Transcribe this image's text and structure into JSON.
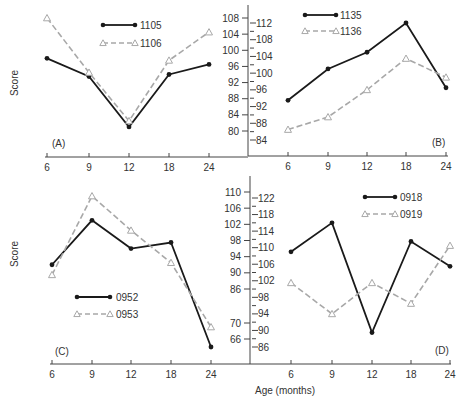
{
  "figure": {
    "y_axis_title": "Score",
    "x_axis_title": "Age (months)",
    "colors": {
      "solid": "#1a1a1a",
      "dashed": "#a8a8a8",
      "axis": "#444444"
    }
  },
  "chart_data": [
    {
      "type": "line",
      "panel": "(A)",
      "categories": [
        "6",
        "9",
        "12",
        "18",
        "24"
      ],
      "xlabel": "Age (months)",
      "ylabel": "Score",
      "yticks": [
        108,
        104,
        100,
        96,
        92,
        88,
        84,
        80
      ],
      "ylim": [
        80,
        108
      ],
      "series": [
        {
          "name": "1105",
          "style": "solid-dot",
          "values": [
            98,
            93.5,
            81,
            94,
            96.5
          ]
        },
        {
          "name": "1106",
          "style": "dashed-triangle",
          "values": [
            108,
            94.5,
            82.5,
            97.5,
            104.5
          ]
        }
      ],
      "legend_position": "top-center",
      "grid": false
    },
    {
      "type": "line",
      "panel": "(B)",
      "categories": [
        "6",
        "9",
        "12",
        "18",
        "24"
      ],
      "xlabel": "Age (months)",
      "ylabel": "Score",
      "yticks": [
        112,
        108,
        104,
        100,
        96,
        92,
        88,
        84
      ],
      "ylim": [
        84,
        112
      ],
      "series": [
        {
          "name": "1135",
          "style": "solid-dot",
          "values": [
            93.5,
            101,
            105,
            112,
            96.5
          ]
        },
        {
          "name": "1136",
          "style": "dashed-triangle",
          "values": [
            86.5,
            89.5,
            96,
            103.5,
            99
          ]
        }
      ],
      "legend_position": "top-left",
      "grid": false
    },
    {
      "type": "line",
      "panel": "(C)",
      "categories": [
        "6",
        "9",
        "12",
        "18",
        "24"
      ],
      "xlabel": "Age (months)",
      "ylabel": "Score",
      "yticks": [
        110,
        106,
        102,
        98,
        94,
        90,
        86,
        70,
        66
      ],
      "ylim": [
        62,
        110
      ],
      "axis_break": [
        70,
        86
      ],
      "series": [
        {
          "name": "0952",
          "style": "solid-dot",
          "values": [
            92,
            103,
            96,
            97.5,
            64
          ]
        },
        {
          "name": "0953",
          "style": "dashed-triangle",
          "values": [
            89.5,
            109,
            100.5,
            92.5,
            69
          ]
        }
      ],
      "legend_position": "center-left",
      "grid": false
    },
    {
      "type": "line",
      "panel": "(D)",
      "categories": [
        "6",
        "9",
        "12",
        "18",
        "24"
      ],
      "xlabel": "Age (months)",
      "ylabel": "Score",
      "yticks": [
        122,
        118,
        114,
        110,
        106,
        102,
        98,
        94,
        90,
        86
      ],
      "ylim": [
        86,
        122
      ],
      "series": [
        {
          "name": "0918",
          "style": "solid-dot",
          "values": [
            109,
            116,
            89.5,
            111.5,
            105.5
          ]
        },
        {
          "name": "0919",
          "style": "dashed-triangle",
          "values": [
            101.5,
            94,
            101.5,
            96.5,
            110.5
          ]
        }
      ],
      "legend_position": "top-right",
      "grid": false
    }
  ]
}
